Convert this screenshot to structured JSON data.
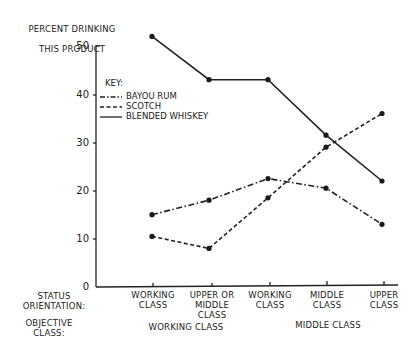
{
  "chart_data": {
    "type": "line",
    "title": "",
    "ylabel": "PERCENT DRINKING THIS PRODUCT",
    "xlabel": "",
    "ylim": [
      0,
      50
    ],
    "yticks": [
      0,
      10,
      20,
      30,
      40,
      50
    ],
    "grid": false,
    "legend_title": "KEY:",
    "legend_position": "upper-left inside",
    "row_labels": {
      "status_orientation": "STATUS ORIENTATION:",
      "objective_class": "OBJECTIVE CLASS:"
    },
    "categories": [
      "WORKING CLASS",
      "UPPER OR MIDDLE CLASS",
      "WORKING CLASS",
      "MIDDLE CLASS",
      "UPPER CLASS"
    ],
    "objective_class_groups": [
      {
        "label": "WORKING CLASS",
        "spans": [
          0,
          1
        ]
      },
      {
        "label": "MIDDLE CLASS",
        "spans": [
          2,
          3,
          4
        ]
      }
    ],
    "series": [
      {
        "name": "BAYOU RUM",
        "style": "dash-dot",
        "values": [
          15,
          18,
          22.5,
          20.5,
          13
        ]
      },
      {
        "name": "SCOTCH",
        "style": "dashed",
        "values": [
          10.5,
          8,
          18.5,
          29,
          36
        ]
      },
      {
        "name": "BLENDED WHISKEY",
        "style": "solid",
        "values": [
          52,
          43,
          43,
          31.5,
          22
        ]
      }
    ]
  },
  "ui": {
    "ylabel_line1": "PERCENT DRINKING",
    "ylabel_line2": "THIS PRODUCT",
    "yticks": [
      "50",
      "40",
      "30",
      "20",
      "10",
      "0"
    ],
    "key_title": "KEY:",
    "key_items": [
      "BAYOU RUM",
      "SCOTCH",
      "BLENDED WHISKEY"
    ],
    "status_label": "STATUS\nORIENTATION:",
    "objective_label": "OBJECTIVE\nCLASS:",
    "xcats": [
      "WORKING\nCLASS",
      "UPPER OR\nMIDDLE\nCLASS",
      "WORKING\nCLASS",
      "MIDDLE\nCLASS",
      "UPPER\nCLASS"
    ],
    "groups": [
      "WORKING CLASS",
      "MIDDLE CLASS"
    ]
  }
}
